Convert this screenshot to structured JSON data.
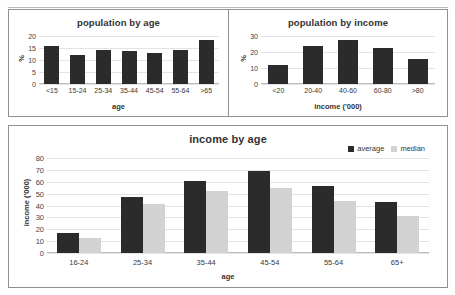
{
  "document": {
    "title": "population and income charts"
  },
  "charts": {
    "population_by_age": {
      "title": "population by age",
      "xlabel": "age",
      "ylabel": "%"
    },
    "population_by_income": {
      "title": "population by income",
      "xlabel": "income ('000)",
      "ylabel": "%"
    },
    "income_by_age": {
      "title": "income by age",
      "xlabel": "age",
      "ylabel": "income ('000)",
      "legend": [
        {
          "label": "average",
          "color": "#2b2b2b"
        },
        {
          "label": "median",
          "color": "#d2d2d2"
        }
      ]
    }
  },
  "chart_data": [
    {
      "type": "bar",
      "title": "population by age",
      "xlabel": "age",
      "ylabel": "%",
      "categories": [
        "<15",
        "15-24",
        "25-34",
        "35-44",
        "45-54",
        "55-64",
        ">65"
      ],
      "values": [
        15.8,
        12.2,
        14.0,
        13.6,
        13.0,
        14.2,
        18.2
      ],
      "ylim": [
        0,
        20
      ],
      "yticks": [
        0,
        5,
        10,
        15,
        20
      ],
      "grid": true,
      "legend": "none",
      "bar_color": "#2b2b2b"
    },
    {
      "type": "bar",
      "title": "population by income",
      "xlabel": "income ('000)",
      "ylabel": "%",
      "categories": [
        "<20",
        "20-40",
        "40-60",
        "60-80",
        ">80"
      ],
      "values": [
        12.0,
        24.0,
        27.2,
        22.6,
        15.6
      ],
      "ylim": [
        0,
        30
      ],
      "yticks": [
        0,
        10,
        20,
        30
      ],
      "grid": true,
      "legend": "none",
      "bar_color": "#2b2b2b"
    },
    {
      "type": "bar",
      "title": "income by age",
      "xlabel": "age",
      "ylabel": "income ('000)",
      "categories": [
        "16-24",
        "25-34",
        "35-44",
        "45-54",
        "55-64",
        "65+"
      ],
      "series": [
        {
          "name": "average",
          "color": "#2b2b2b",
          "values": [
            17,
            47,
            61,
            69,
            56.5,
            43
          ]
        },
        {
          "name": "median",
          "color": "#d2d2d2",
          "values": [
            12.5,
            41.5,
            52,
            55,
            43.5,
            31.5
          ]
        }
      ],
      "ylim": [
        0,
        80
      ],
      "yticks": [
        0,
        10,
        20,
        30,
        40,
        50,
        60,
        70,
        80
      ],
      "grid": true,
      "legend": "top-right"
    }
  ]
}
